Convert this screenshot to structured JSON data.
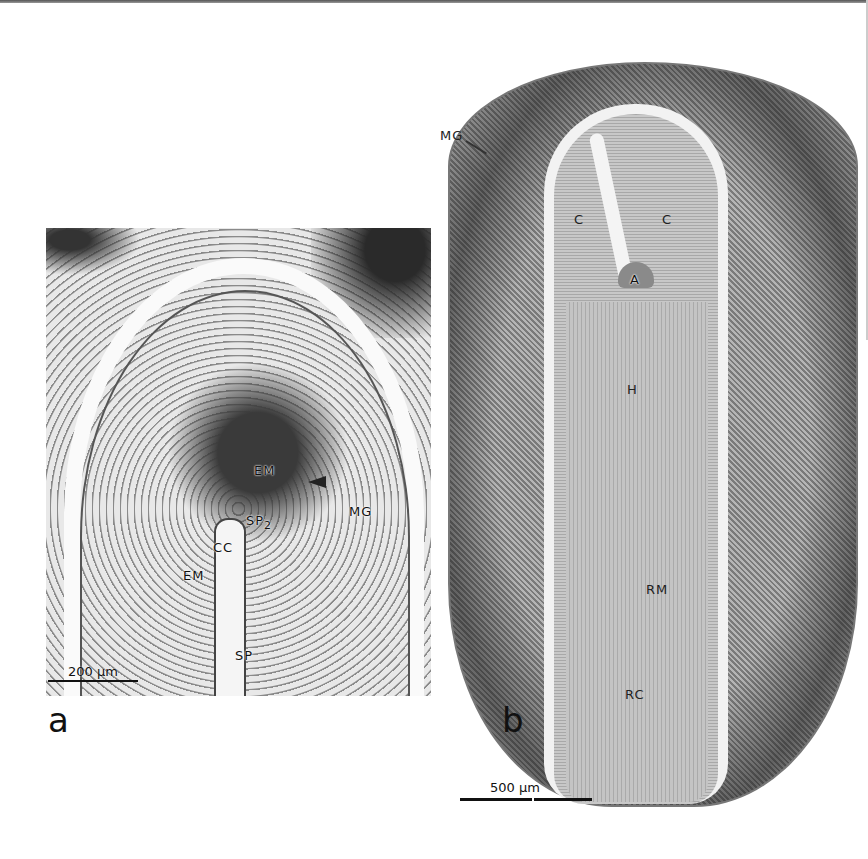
{
  "figure": {
    "panels": [
      {
        "id": "a",
        "letter": "a",
        "labels": {
          "em_upper": "EM",
          "mg": "MG",
          "sp2": "SP",
          "sp2_sub": "2",
          "cc": "CC",
          "em_lower": "EM",
          "sp": "SP"
        },
        "scale_bar": "200 µm",
        "arrowhead": "arrowhead-indicator"
      },
      {
        "id": "b",
        "letter": "b",
        "labels": {
          "mg": "MG",
          "c_left": "C",
          "c_right": "C",
          "a": "A",
          "h": "H",
          "rm": "RM",
          "rc": "RC"
        },
        "scale_bar": "500 µm"
      }
    ]
  }
}
